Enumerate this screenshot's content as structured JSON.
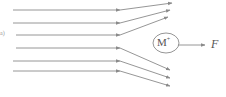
{
  "panel_label": "a)",
  "ion": {
    "label": "M",
    "superscript": "+"
  },
  "fragment": {
    "label": "F"
  },
  "colors": {
    "line": "#8a8a8a",
    "text": "#555555"
  },
  "beams": {
    "upper_deflected_up": 3,
    "lower_deflected_down": 3
  }
}
